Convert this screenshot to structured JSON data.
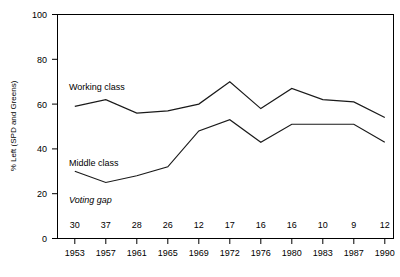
{
  "chart_data": {
    "type": "line",
    "title": "",
    "xlabel": "",
    "ylabel": "% Left (SPD and Greens)",
    "ylim": [
      0,
      100
    ],
    "yticks": [
      0,
      20,
      40,
      60,
      80,
      100
    ],
    "grid": false,
    "legend_position": "inline-annotations",
    "categories": [
      "1953",
      "1957",
      "1961",
      "1965",
      "1969",
      "1972",
      "1976",
      "1980",
      "1983",
      "1987",
      "1990"
    ],
    "series": [
      {
        "name": "Working class",
        "values": [
          59,
          62,
          56,
          57,
          60,
          70,
          58,
          67,
          62,
          61,
          54
        ]
      },
      {
        "name": "Middle class",
        "values": [
          30,
          25,
          28,
          32,
          48,
          53,
          43,
          51,
          51,
          51,
          43
        ]
      }
    ],
    "annotations": {
      "voting_gap_label": "Voting gap",
      "voting_gap_values": [
        "30",
        "37",
        "28",
        "26",
        "12",
        "17",
        "16",
        "16",
        "10",
        "9",
        "12"
      ]
    },
    "labels": {
      "working_class": "Working class",
      "middle_class": "Middle class"
    }
  }
}
